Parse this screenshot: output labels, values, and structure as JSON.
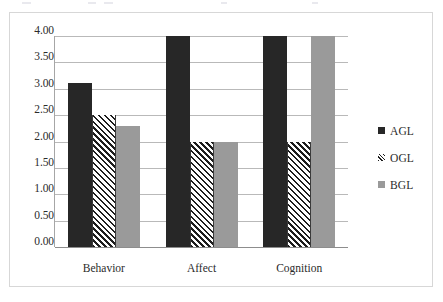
{
  "chart_data": {
    "type": "bar",
    "title": "",
    "subtitle": "",
    "xlabel": "",
    "ylabel": "",
    "categories": [
      "Behavior",
      "Affect",
      "Cognition"
    ],
    "series": [
      {
        "name": "AGL",
        "values": [
          3.1,
          4.0,
          4.0
        ],
        "color": "#272727",
        "fill": "solid"
      },
      {
        "name": "OGL",
        "values": [
          2.5,
          2.0,
          2.0
        ],
        "color": "#1e1e1e",
        "fill": "diagonal-hatch"
      },
      {
        "name": "BGL",
        "values": [
          2.3,
          2.0,
          4.0
        ],
        "color": "#9a9a9a",
        "fill": "solid"
      }
    ],
    "ylim": [
      0.0,
      4.0
    ],
    "ytick_step": 0.5,
    "ytick_labels": [
      "4.00",
      "3.50",
      "3.00",
      "2.50",
      "2.00",
      "1.50",
      "1.00",
      "0.50",
      "0.00"
    ],
    "ytick_values": [
      4.0,
      3.5,
      3.0,
      2.5,
      2.0,
      1.5,
      1.0,
      0.5,
      0.0
    ],
    "grid": true,
    "grid_axis": "y",
    "legend_position": "right",
    "legend_entries": [
      "AGL",
      "OGL",
      "BGL"
    ],
    "plot_background": "#ffffff",
    "gridline_color": "#b9b9b9",
    "frame_border_color": "#d7d7d7",
    "text_color": "#2b2b2b"
  }
}
